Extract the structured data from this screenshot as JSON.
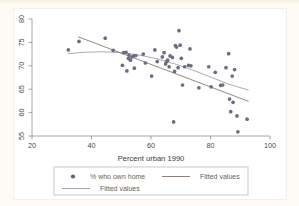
{
  "chart_data": {
    "type": "scatter",
    "title": "",
    "xlabel": "Percent urban 1990",
    "ylabel": "",
    "xlim": [
      20,
      100
    ],
    "ylim": [
      53,
      81
    ],
    "xticks": [
      20,
      40,
      60,
      80,
      100
    ],
    "xticklabels": [
      "20",
      "40",
      "60",
      "80",
      "100"
    ],
    "yticks": [
      55,
      60,
      65,
      70,
      75,
      80
    ],
    "yticklabels": [
      "55",
      "60",
      "65",
      "70",
      "75",
      "80"
    ],
    "grid": false,
    "legend_position": "below-plot",
    "marker_color": "#6b6d86",
    "line_colors": [
      "#8a6f5e",
      "#9b9ba6"
    ],
    "series": [
      {
        "name": "% who own home",
        "type": "scatter",
        "points": [
          [
            32.2,
            73.4
          ],
          [
            35.8,
            75.2
          ],
          [
            44.6,
            75.9
          ],
          [
            47.3,
            73.3
          ],
          [
            50.4,
            70.1
          ],
          [
            50.8,
            72.8
          ],
          [
            51.6,
            72.9
          ],
          [
            51.9,
            68.9
          ],
          [
            52.4,
            71.6
          ],
          [
            52.6,
            72.3
          ],
          [
            53.1,
            71.2
          ],
          [
            53.6,
            71.9
          ],
          [
            54.2,
            72.1
          ],
          [
            54.4,
            69.5
          ],
          [
            54.9,
            72.2
          ],
          [
            57.4,
            72.5
          ],
          [
            58.1,
            70.6
          ],
          [
            60.2,
            67.8
          ],
          [
            61.3,
            73.4
          ],
          [
            62.1,
            70.9
          ],
          [
            63.8,
            71.9
          ],
          [
            64.4,
            72.8
          ],
          [
            64.9,
            70.4
          ],
          [
            65.3,
            70.9
          ],
          [
            65.6,
            71.2
          ],
          [
            66.1,
            69.8
          ],
          [
            66.4,
            72.1
          ],
          [
            67.2,
            71.8
          ],
          [
            67.6,
            58.0
          ],
          [
            67.9,
            68.8
          ],
          [
            68.2,
            74.3
          ],
          [
            68.6,
            74.0
          ],
          [
            69.1,
            69.6
          ],
          [
            69.4,
            77.5
          ],
          [
            69.8,
            74.4
          ],
          [
            70.2,
            71.6
          ],
          [
            70.6,
            65.9
          ],
          [
            71.3,
            69.8
          ],
          [
            72.6,
            70.1
          ],
          [
            73.1,
            73.6
          ],
          [
            73.4,
            70.0
          ],
          [
            76.1,
            65.3
          ],
          [
            79.4,
            69.8
          ],
          [
            80.2,
            65.5
          ],
          [
            81.6,
            68.6
          ],
          [
            83.4,
            65.8
          ],
          [
            84.1,
            65.9
          ],
          [
            85.2,
            69.6
          ],
          [
            86.1,
            72.6
          ],
          [
            86.4,
            62.9
          ],
          [
            86.8,
            60.2
          ],
          [
            87.3,
            67.8
          ],
          [
            87.6,
            62.2
          ],
          [
            88.1,
            69.2
          ],
          [
            88.9,
            59.3
          ],
          [
            89.2,
            55.9
          ],
          [
            92.3,
            58.6
          ]
        ]
      },
      {
        "name": "Fitted values",
        "type": "line",
        "style": "linear",
        "points": [
          [
            35.5,
            76.2
          ],
          [
            92.8,
            62.4
          ]
        ]
      },
      {
        "name": "Fitted values",
        "type": "line",
        "style": "quadratic",
        "points": [
          [
            32.0,
            72.6
          ],
          [
            38.0,
            72.9
          ],
          [
            44.0,
            73.0
          ],
          [
            50.0,
            72.8
          ],
          [
            56.0,
            72.3
          ],
          [
            62.0,
            71.5
          ],
          [
            68.0,
            70.4
          ],
          [
            74.0,
            69.1
          ],
          [
            80.0,
            67.6
          ],
          [
            86.0,
            66.1
          ],
          [
            92.8,
            64.8
          ]
        ]
      }
    ],
    "legend_entries": [
      {
        "label": "% who own home",
        "kind": "marker",
        "color": "#5c5f7d"
      },
      {
        "label": "Fitted values",
        "kind": "line",
        "color": "#8a6f5e"
      },
      {
        "label": "Fitted values",
        "kind": "line",
        "color": "#9b9ba6"
      }
    ]
  }
}
